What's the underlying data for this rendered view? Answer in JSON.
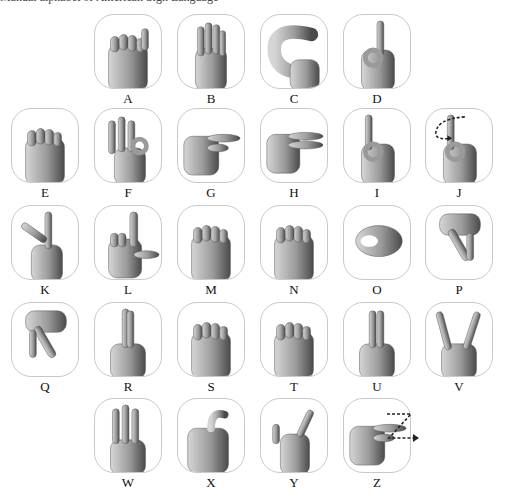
{
  "caption": "Manual alphabet of American Sign Language",
  "colors": {
    "tile_border": "#c9c9c9",
    "skin_dark": "#4a4a4a",
    "skin_mid": "#9a9a9a",
    "skin_light": "#d6d6d6",
    "arrow": "#222222"
  },
  "signs": [
    {
      "letter": "A",
      "shape": "fist-thumb-side",
      "x": 94,
      "y": 14
    },
    {
      "letter": "B",
      "shape": "flat-palm",
      "x": 177,
      "y": 14
    },
    {
      "letter": "C",
      "shape": "c-curve",
      "x": 260,
      "y": 14
    },
    {
      "letter": "D",
      "shape": "index-up-circle",
      "x": 343,
      "y": 14
    },
    {
      "letter": "E",
      "shape": "curled-fingers",
      "x": 11,
      "y": 108
    },
    {
      "letter": "F",
      "shape": "three-up-ok",
      "x": 94,
      "y": 108
    },
    {
      "letter": "G",
      "shape": "index-side",
      "x": 177,
      "y": 108
    },
    {
      "letter": "H",
      "shape": "two-side",
      "x": 260,
      "y": 108
    },
    {
      "letter": "I",
      "shape": "pinky-up",
      "x": 343,
      "y": 108
    },
    {
      "letter": "J",
      "shape": "pinky-up",
      "x": 425,
      "y": 108,
      "motion": "j-arrow"
    },
    {
      "letter": "K",
      "shape": "k-shape",
      "x": 11,
      "y": 205
    },
    {
      "letter": "L",
      "shape": "l-shape",
      "x": 94,
      "y": 205
    },
    {
      "letter": "M",
      "shape": "fist",
      "x": 177,
      "y": 205
    },
    {
      "letter": "N",
      "shape": "fist",
      "x": 260,
      "y": 205
    },
    {
      "letter": "O",
      "shape": "o-shape",
      "x": 343,
      "y": 205
    },
    {
      "letter": "P",
      "shape": "p-down",
      "x": 425,
      "y": 205
    },
    {
      "letter": "Q",
      "shape": "q-down",
      "x": 11,
      "y": 302
    },
    {
      "letter": "R",
      "shape": "crossed-up",
      "x": 94,
      "y": 302
    },
    {
      "letter": "S",
      "shape": "fist",
      "x": 177,
      "y": 302
    },
    {
      "letter": "T",
      "shape": "fist",
      "x": 260,
      "y": 302
    },
    {
      "letter": "U",
      "shape": "two-up",
      "x": 343,
      "y": 302
    },
    {
      "letter": "V",
      "shape": "v-up",
      "x": 425,
      "y": 302
    },
    {
      "letter": "W",
      "shape": "three-up",
      "x": 94,
      "y": 398
    },
    {
      "letter": "X",
      "shape": "hook",
      "x": 177,
      "y": 398
    },
    {
      "letter": "Y",
      "shape": "y-shape",
      "x": 260,
      "y": 398
    },
    {
      "letter": "Z",
      "shape": "index-side",
      "x": 343,
      "y": 398,
      "motion": "z-arrow"
    }
  ]
}
